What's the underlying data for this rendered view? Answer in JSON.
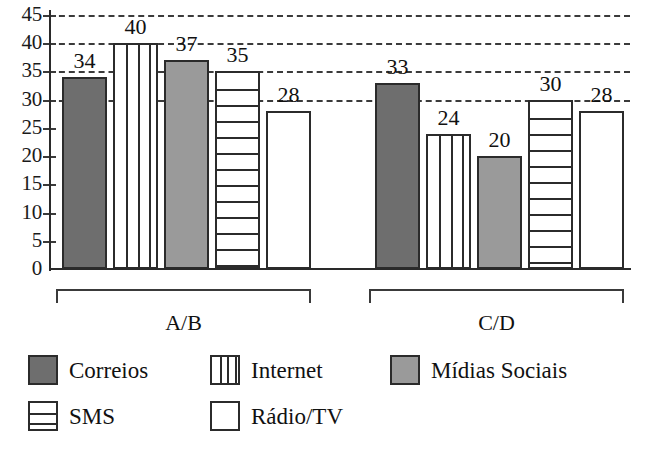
{
  "chart_data": {
    "type": "bar",
    "title": "",
    "xlabel": "",
    "ylabel": "",
    "ylim": [
      0,
      45
    ],
    "grid": true,
    "legend_position": "bottom",
    "categories": [
      "A/B",
      "C/D"
    ],
    "series": [
      {
        "name": "Correios",
        "pattern": "solid-dark",
        "values": [
          34,
          33
        ]
      },
      {
        "name": "Internet",
        "pattern": "vstripe",
        "values": [
          40,
          24
        ]
      },
      {
        "name": "Mídias Sociais",
        "pattern": "solid-light",
        "values": [
          37,
          20
        ]
      },
      {
        "name": "SMS",
        "pattern": "hstripe",
        "values": [
          35,
          30
        ]
      },
      {
        "name": "Rádio/TV",
        "pattern": "plain",
        "values": [
          28,
          28
        ]
      }
    ],
    "y_ticks": [
      "0",
      "5",
      "10",
      "15",
      "20",
      "25",
      "30",
      "35",
      "40",
      "45"
    ],
    "bar_labels": {
      "A/B": [
        "34",
        "40",
        "37",
        "35",
        "28"
      ],
      "C/D": [
        "33",
        "24",
        "20",
        "30",
        "28"
      ]
    },
    "colors": {
      "solid_dark": "#6e6e6e",
      "solid_light": "#9a9a9a",
      "outline": "#2b2b2b",
      "grid": "#3a3a3a",
      "background": "#ffffff"
    }
  },
  "legend": {
    "rows": [
      [
        {
          "label": "Correios",
          "pattern": "solid-dark"
        },
        {
          "label": "Internet",
          "pattern": "vstripe"
        },
        {
          "label": "Mídias Sociais",
          "pattern": "solid-light"
        }
      ],
      [
        {
          "label": "SMS",
          "pattern": "hstripe"
        },
        {
          "label": "Rádio/TV",
          "pattern": "plain"
        }
      ]
    ]
  },
  "groups": [
    {
      "label": "A/B"
    },
    {
      "label": "C/D"
    }
  ]
}
